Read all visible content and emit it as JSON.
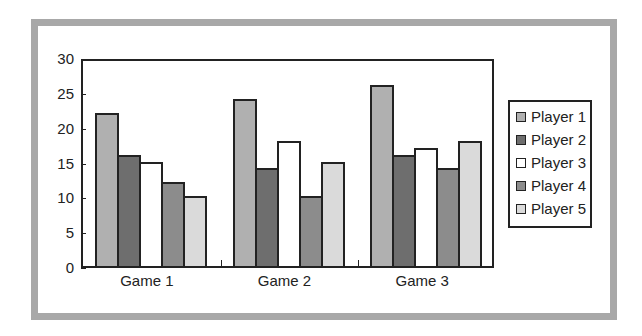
{
  "chart_data": {
    "type": "bar",
    "title": "",
    "xlabel": "",
    "ylabel": "",
    "categories": [
      "Game 1",
      "Game 2",
      "Game 3"
    ],
    "series": [
      {
        "name": "Player 1",
        "color": "#b0b0b0",
        "values": [
          22,
          24,
          26
        ]
      },
      {
        "name": "Player 2",
        "color": "#6e6e6e",
        "values": [
          16,
          14,
          16
        ]
      },
      {
        "name": "Player 3",
        "color": "#ffffff",
        "values": [
          15,
          18,
          17
        ]
      },
      {
        "name": "Player 4",
        "color": "#8c8c8c",
        "values": [
          12,
          10,
          14
        ]
      },
      {
        "name": "Player 5",
        "color": "#dadada",
        "values": [
          10,
          15,
          18
        ]
      }
    ],
    "ylim": [
      0,
      30
    ],
    "yticks": [
      0,
      5,
      10,
      15,
      20,
      25,
      30
    ],
    "grid": false,
    "legend_position": "right"
  },
  "frame_color": "#a8a8a8"
}
